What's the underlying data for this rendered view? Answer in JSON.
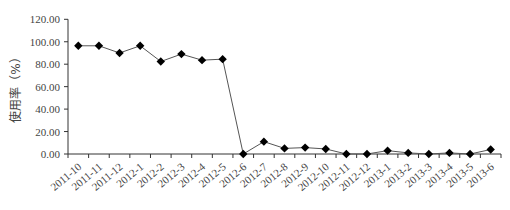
{
  "chart_data": {
    "type": "line",
    "title": "",
    "xlabel": "",
    "ylabel": "使用率（%）",
    "ylim": [
      0,
      120
    ],
    "yticks": [
      "0.00",
      "20.00",
      "40.00",
      "60.00",
      "80.00",
      "100.00",
      "120.00"
    ],
    "grid": false,
    "legend": null,
    "categories": [
      "2011-10",
      "2011-11",
      "2011-12",
      "2012-1",
      "2012-2",
      "2012-3",
      "2012-4",
      "2012-5",
      "2012-6",
      "2012-7",
      "2012-8",
      "2012-9",
      "2012-10",
      "2012-11",
      "2012-12",
      "2013-1",
      "2013-2",
      "2013-3",
      "2013-4",
      "2013-5",
      "2013-6"
    ],
    "series": [
      {
        "name": "使用率",
        "marker": "diamond",
        "color": "#000000",
        "values": [
          96.4,
          96.4,
          90.0,
          96.4,
          82.4,
          89.0,
          83.6,
          84.5,
          0.0,
          11.0,
          5.0,
          5.7,
          4.5,
          0.0,
          0.0,
          3.0,
          1.0,
          0.0,
          1.0,
          0.0,
          4.0
        ]
      }
    ]
  }
}
